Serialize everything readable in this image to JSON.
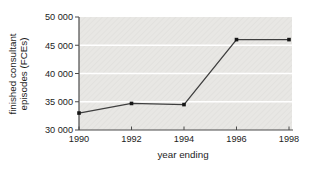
{
  "figure": {
    "xlabel": "year ending",
    "ylabel_line1": "finished consultant",
    "ylabel_line2": "episodes (FCEs)"
  },
  "chart_data": {
    "type": "line",
    "x": [
      1990,
      1992,
      1994,
      1996,
      1998
    ],
    "x_labels": [
      "1990",
      "1992",
      "1994",
      "1996",
      "1998"
    ],
    "series": [
      {
        "name": "finished consultant episodes (FCEs)",
        "values": [
          33000,
          34700,
          34500,
          46000,
          46000
        ]
      }
    ],
    "title": "",
    "xlabel": "year ending",
    "ylabel": "finished consultant episodes (FCEs)",
    "ylim": [
      30000,
      50000
    ],
    "ytick_values": [
      30000,
      35000,
      40000,
      45000,
      50000
    ],
    "ytick_labels": [
      "30 000",
      "35 000",
      "40 000",
      "45 000",
      "50 000"
    ],
    "grid": "horizontal-white-on-gray-panel",
    "legend_position": "none",
    "marker": "square"
  },
  "colors": {
    "page_bg": "#ffffff",
    "plot_bg": "#e8e7e4",
    "plot_hatch": "#dedddb",
    "gridline": "#ffffff",
    "axis": "#4a4a4a",
    "line": "#3f3f3f",
    "marker": "#161616",
    "text": "#1c1c1c"
  }
}
